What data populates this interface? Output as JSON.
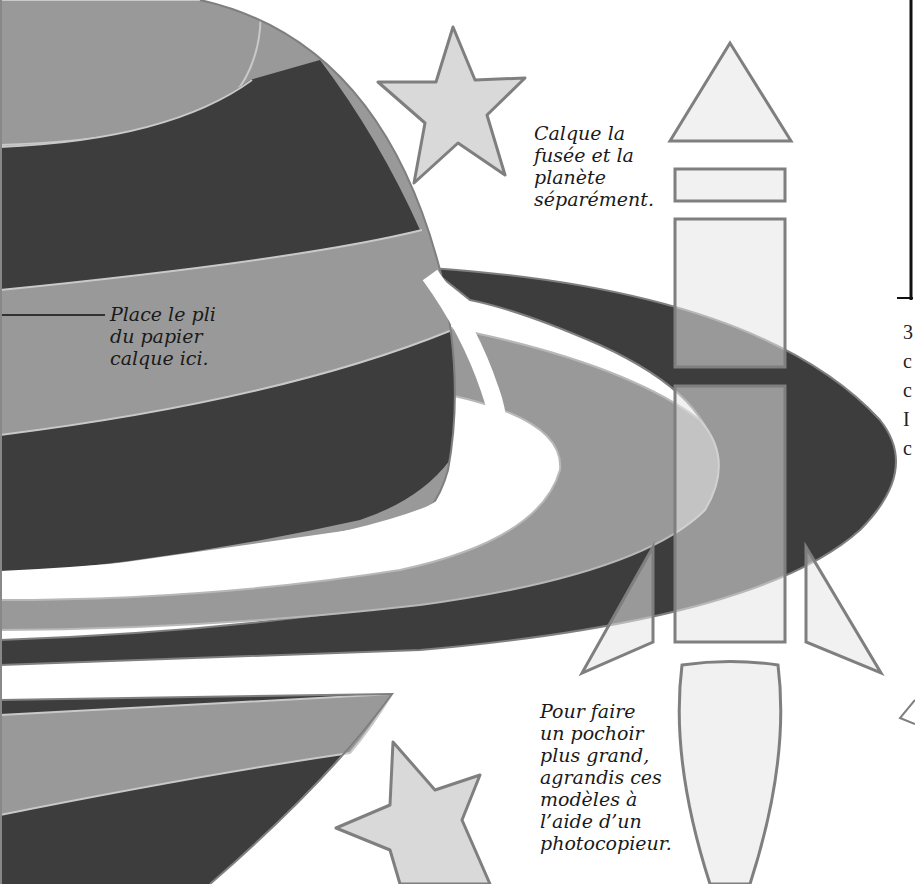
{
  "page": {
    "type": "stencil-template-page",
    "colors": {
      "dark_band": "#3d3d3d",
      "mid_band": "#999999",
      "light_shape": "#e6e6e6",
      "outline": "#7f7f7f",
      "star_fill": "#d9d9d9",
      "text": "#1a1a1a"
    }
  },
  "captions": {
    "trace_separately": "Calque la\nfusée et la\nplanète\nséparément.",
    "fold_line": "Place le pli\ndu papier\ncalque ici.",
    "enlarge": "Pour faire\nun pochoir\nplus grand,\nagrandis ces\nmodèles à\nl’aide d’un\nphotocopieur."
  },
  "shapes": {
    "planet": "planet-with-rings",
    "rocket_parts": [
      "nose-cone-triangle",
      "collar-rectangle",
      "upper-body-rectangle",
      "lower-body-rectangle",
      "left-fin",
      "right-fin",
      "exhaust-flame"
    ],
    "stars": [
      "star-top",
      "star-bottom"
    ]
  },
  "right_edge": {
    "fragments": "3\nc\nc\nI\nc"
  }
}
